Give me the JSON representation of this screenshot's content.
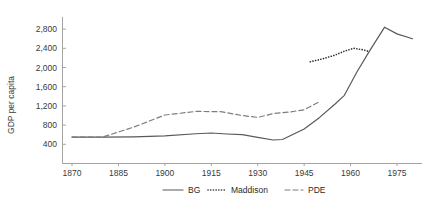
{
  "chart_data": {
    "type": "line",
    "title": "",
    "xlabel": "",
    "ylabel": "GDP per capita",
    "xlim": [
      1870,
      1980
    ],
    "ylim": [
      0,
      2900
    ],
    "grid": false,
    "legend_position": "bottom-center",
    "x_ticks": [
      1870,
      1885,
      1900,
      1915,
      1930,
      1945,
      1960,
      1975
    ],
    "x_tick_labels": [
      "1870",
      "1885",
      "1900",
      "1915",
      "1930",
      "1945",
      "1960",
      "1975"
    ],
    "y_ticks": [
      400,
      800,
      1200,
      1600,
      2000,
      2400,
      2800
    ],
    "y_tick_labels": [
      "400",
      "800",
      "1,200",
      "1,600",
      "2,000",
      "2,400",
      "2,800"
    ],
    "series": [
      {
        "name": "BG",
        "style": "solid",
        "color": "#595959",
        "points": [
          [
            1870,
            550
          ],
          [
            1880,
            548
          ],
          [
            1890,
            555
          ],
          [
            1900,
            575
          ],
          [
            1910,
            620
          ],
          [
            1915,
            635
          ],
          [
            1920,
            615
          ],
          [
            1925,
            600
          ],
          [
            1930,
            545
          ],
          [
            1935,
            490
          ],
          [
            1938,
            500
          ],
          [
            1945,
            720
          ],
          [
            1950,
            960
          ],
          [
            1955,
            1240
          ],
          [
            1958,
            1420
          ],
          [
            1962,
            1900
          ],
          [
            1966,
            2330
          ],
          [
            1971,
            2840
          ],
          [
            1975,
            2700
          ],
          [
            1980,
            2600
          ]
        ]
      },
      {
        "name": "Maddison",
        "style": "dotted",
        "color": "#2e2e2e",
        "points": [
          [
            1947,
            2120
          ],
          [
            1951,
            2180
          ],
          [
            1955,
            2260
          ],
          [
            1958,
            2340
          ],
          [
            1961,
            2400
          ],
          [
            1964,
            2370
          ],
          [
            1966,
            2330
          ]
        ]
      },
      {
        "name": "PDE",
        "style": "dashed",
        "color": "#7d7d7d",
        "points": [
          [
            1870,
            550
          ],
          [
            1880,
            552
          ],
          [
            1890,
            760
          ],
          [
            1900,
            1010
          ],
          [
            1910,
            1085
          ],
          [
            1918,
            1080
          ],
          [
            1925,
            1000
          ],
          [
            1930,
            960
          ],
          [
            1935,
            1040
          ],
          [
            1940,
            1070
          ],
          [
            1945,
            1120
          ],
          [
            1950,
            1290
          ]
        ]
      }
    ]
  },
  "legend": {
    "items": [
      {
        "label": "BG",
        "style": "solid"
      },
      {
        "label": "Maddison",
        "style": "dotted"
      },
      {
        "label": "PDE",
        "style": "dashed"
      }
    ]
  }
}
